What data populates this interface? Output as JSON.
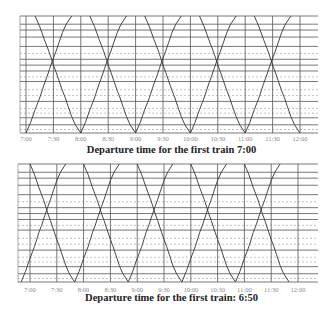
{
  "chart_data": [
    {
      "type": "line",
      "title": "Departure time for the first train 7:00",
      "xlabel": "",
      "ylabel": "",
      "x_ticks": [
        "7:00",
        "7:30",
        "8:00",
        "8:30",
        "9:00",
        "9:30",
        "10:00",
        "10:30",
        "11:00",
        "11:30",
        "12:00"
      ],
      "x_range": [
        "7:00",
        "12:00"
      ],
      "grid": true,
      "solid_hlines_frac": [
        0.0,
        0.07,
        0.12,
        0.18,
        0.26,
        0.37,
        0.42,
        0.47,
        0.56,
        0.73,
        0.87,
        0.93,
        1.0
      ],
      "dashed_hlines_frac": [
        0.32,
        0.52,
        0.63,
        0.68,
        0.79,
        0.83,
        0.97
      ],
      "series": [
        {
          "name": "down trains",
          "departures": [
            "7:00",
            "8:00",
            "9:00",
            "10:00",
            "11:00"
          ],
          "direction": "up"
        },
        {
          "name": "up trains",
          "departures": [
            "7:10",
            "8:10",
            "9:10",
            "10:10",
            "11:10"
          ],
          "direction": "down"
        }
      ]
    },
    {
      "type": "line",
      "title": "Departure time for the first train: 6:50",
      "xlabel": "",
      "ylabel": "",
      "x_ticks": [
        "7:00",
        "7:30",
        "8:00",
        "8:30",
        "9:00",
        "9:30",
        "10:00",
        "10:30",
        "11:00",
        "11:30",
        "12:00"
      ],
      "x_range": [
        "6:50",
        "12:00"
      ],
      "grid": true,
      "solid_hlines_frac": [
        0.0,
        0.07,
        0.12,
        0.18,
        0.26,
        0.37,
        0.42,
        0.47,
        0.56,
        0.73,
        0.87,
        0.93,
        1.0
      ],
      "dashed_hlines_frac": [
        0.32,
        0.52,
        0.63,
        0.68,
        0.79,
        0.83,
        0.97
      ],
      "series": [
        {
          "name": "down trains",
          "departures": [
            "6:50",
            "7:50",
            "8:50",
            "9:50",
            "10:50"
          ],
          "direction": "up"
        },
        {
          "name": "up trains",
          "departures": [
            "7:00",
            "8:00",
            "9:00",
            "10:00",
            "11:00"
          ],
          "direction": "down"
        }
      ]
    }
  ],
  "captions": {
    "top": "Departure time for the first train 7:00",
    "bottom": "Departure time for the first train: 6:50"
  }
}
